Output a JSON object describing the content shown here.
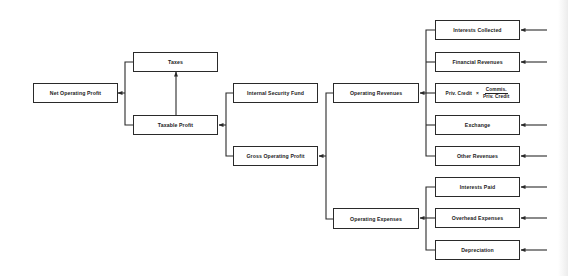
{
  "diagram": {
    "title": "",
    "nodes": {
      "net_operating_profit": "Net Operating Profit",
      "taxes": "Taxes",
      "taxable_profit": "Taxable Profit",
      "internal_security_fund": "Internal Security Fund",
      "gross_operating_profit": "Gross Operating Profit",
      "operating_revenues": "Operating Revenues",
      "operating_expenses": "Operating Expenses",
      "interests_collected": "Interests Collected",
      "financial_revenues": "Financial Revenues",
      "priv_credit": {
        "left": "Priv. Credit",
        "operator": "×",
        "numerator": "Commis.",
        "denominator": "Priv. Credit"
      },
      "exchange": "Exchange",
      "other_revenues": "Other Revenues",
      "interests_paid": "Interests Paid",
      "overhead_expenses": "Overhead Expenses",
      "depreciation": "Depreciation"
    },
    "edges": [
      {
        "from": "taxes",
        "to": "net_operating_profit"
      },
      {
        "from": "taxable_profit",
        "to": "net_operating_profit"
      },
      {
        "from": "taxable_profit",
        "to": "taxes"
      },
      {
        "from": "internal_security_fund",
        "to": "taxable_profit"
      },
      {
        "from": "gross_operating_profit",
        "to": "taxable_profit"
      },
      {
        "from": "operating_revenues",
        "to": "gross_operating_profit"
      },
      {
        "from": "operating_expenses",
        "to": "gross_operating_profit"
      },
      {
        "from": "interests_collected",
        "to": "operating_revenues"
      },
      {
        "from": "financial_revenues",
        "to": "operating_revenues"
      },
      {
        "from": "priv_credit",
        "to": "operating_revenues"
      },
      {
        "from": "exchange",
        "to": "operating_revenues"
      },
      {
        "from": "other_revenues",
        "to": "operating_revenues"
      },
      {
        "from": "interests_paid",
        "to": "operating_expenses"
      },
      {
        "from": "overhead_expenses",
        "to": "operating_expenses"
      },
      {
        "from": "depreciation",
        "to": "operating_expenses"
      }
    ],
    "external_inputs": [
      "interests_collected",
      "financial_revenues",
      "exchange",
      "other_revenues",
      "interests_paid",
      "overhead_expenses",
      "depreciation"
    ],
    "colors": {
      "line": "#2a2a2a",
      "background": "#ffffff"
    }
  }
}
